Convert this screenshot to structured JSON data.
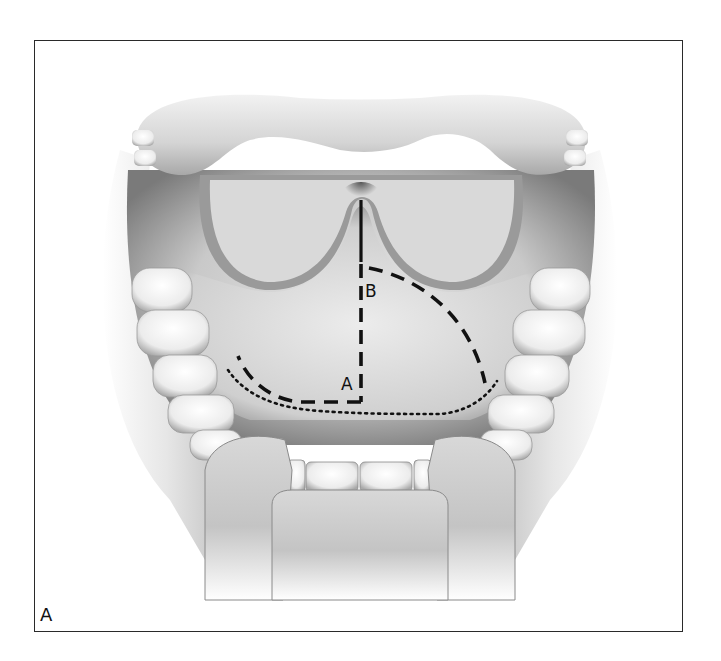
{
  "figure": {
    "panel_label": "A",
    "labels": {
      "point_a": "A",
      "point_b": "B"
    },
    "line_styles": {
      "midline_solid": "solid",
      "midline_dashed": "dashed",
      "flap_a": "dashed",
      "flap_b": "dashed",
      "lower_boundary": "dotted"
    },
    "colors": {
      "ink": "#111111",
      "frame": "#2a2a2a",
      "tissue_light": "#e6e6e6",
      "tissue_mid": "#bdbdbd",
      "tissue_dark": "#6e6e6e",
      "teeth": "#f4f4f4",
      "background": "#ffffff"
    }
  }
}
